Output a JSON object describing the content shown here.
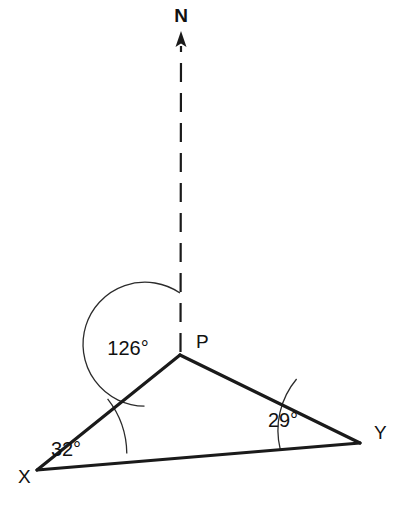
{
  "diagram": {
    "type": "bearing-triangle",
    "background_color": "#ffffff",
    "line_color": "#1a1a1a",
    "compass": {
      "label": "N",
      "icon": "north-arrow-icon",
      "line_style": "dashed"
    },
    "vertices": [
      {
        "id": "P",
        "label": "P",
        "x": 180,
        "y": 355,
        "label_x": 196,
        "label_y": 348
      },
      {
        "id": "X",
        "label": "X",
        "x": 37,
        "y": 470,
        "label_x": 18,
        "label_y": 483
      },
      {
        "id": "Y",
        "label": "Y",
        "x": 360,
        "y": 443,
        "label_x": 374,
        "label_y": 439
      }
    ],
    "angles": [
      {
        "at": "P",
        "value": 126,
        "label": "126°",
        "label_x": 128,
        "label_y": 355,
        "arc_radius": 62
      },
      {
        "at": "X",
        "value": 32,
        "label": "32°",
        "label_x": 66,
        "label_y": 456,
        "arc_radius": 90
      },
      {
        "at": "Y",
        "value": 29,
        "label": "29°",
        "label_x": 283,
        "label_y": 427,
        "arc_radius": 80
      }
    ],
    "edges": [
      {
        "from": "P",
        "to": "X"
      },
      {
        "from": "P",
        "to": "Y"
      },
      {
        "from": "X",
        "to": "Y"
      }
    ],
    "north_reference": {
      "from_x": 180,
      "from_y": 355,
      "to_x": 181,
      "to_y": 40,
      "arrow_tip_y": 32,
      "label_x": 181,
      "label_y": 22
    }
  }
}
